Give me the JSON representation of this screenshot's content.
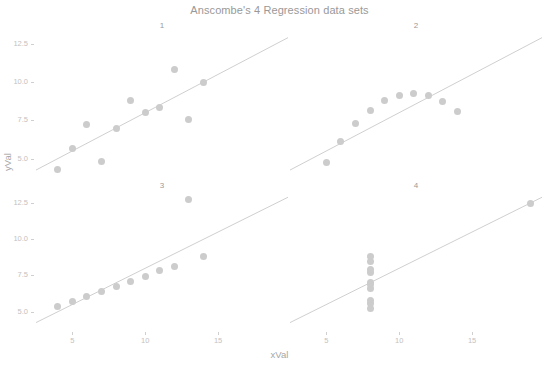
{
  "chart_data": {
    "type": "scatter",
    "title": "Anscombe's 4 Regression data sets",
    "xlabel": "xVal",
    "ylabel": "yVal",
    "grid": false,
    "legend": "none",
    "facet_labels": [
      "1",
      "2",
      "3",
      "4"
    ],
    "xlim": [
      2.5,
      19.8
    ],
    "ylim": [
      3.6,
      13.4
    ],
    "xticks": [
      5,
      10,
      15
    ],
    "xtick_labels": [
      "5",
      "10",
      "15"
    ],
    "yticks": [
      5.0,
      7.5,
      10.0,
      12.5
    ],
    "ytick_labels": [
      "5.0",
      "7.5",
      "10.0",
      "12.5"
    ],
    "point_color": "#cccccc",
    "line_color": "#c9c9c9",
    "text_color": "#a6a6a6",
    "background": "#ffffff",
    "panels": [
      {
        "label": "1",
        "x": [
          10,
          8,
          13,
          9,
          11,
          14,
          6,
          4,
          12,
          7,
          5
        ],
        "y": [
          8.04,
          6.95,
          7.58,
          8.81,
          8.33,
          9.96,
          7.24,
          4.26,
          10.84,
          4.82,
          5.68
        ],
        "fit": {
          "intercept": 3.0,
          "slope": 0.5
        }
      },
      {
        "label": "2",
        "x": [
          10,
          8,
          13,
          9,
          11,
          14,
          6,
          4,
          12,
          7,
          5
        ],
        "y": [
          9.14,
          8.14,
          8.74,
          8.77,
          9.26,
          8.1,
          6.13,
          3.1,
          9.13,
          7.26,
          4.74
        ],
        "fit": {
          "intercept": 3.0,
          "slope": 0.5
        }
      },
      {
        "label": "3",
        "x": [
          10,
          8,
          13,
          9,
          11,
          14,
          6,
          4,
          12,
          7,
          5
        ],
        "y": [
          7.46,
          6.77,
          12.74,
          7.11,
          7.81,
          8.84,
          6.08,
          5.39,
          8.15,
          6.42,
          5.73
        ],
        "fit": {
          "intercept": 3.0,
          "slope": 0.5
        }
      },
      {
        "label": "4",
        "x": [
          8,
          8,
          8,
          8,
          8,
          8,
          8,
          19,
          8,
          8,
          8
        ],
        "y": [
          6.58,
          5.76,
          7.71,
          8.84,
          8.47,
          7.04,
          5.25,
          12.5,
          5.56,
          7.91,
          6.89
        ],
        "fit": {
          "intercept": 3.0,
          "slope": 0.5
        }
      }
    ]
  },
  "axes": {
    "x_title": "xVal",
    "y_title": "yVal"
  }
}
